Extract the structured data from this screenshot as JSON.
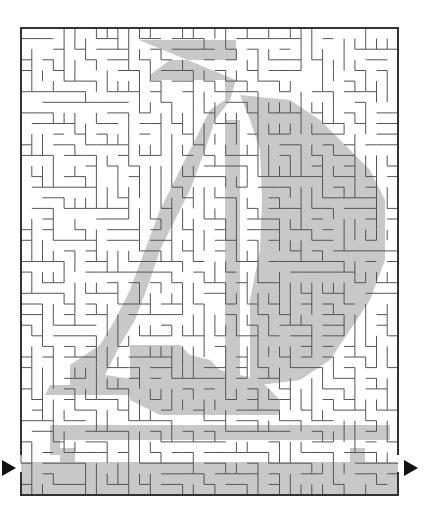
{
  "maze": {
    "title": "Sailboat maze",
    "bounds": {
      "x": 21,
      "y": 28,
      "width": 377,
      "height": 467
    },
    "cols": 35,
    "rows": 44,
    "wall_color": "#555555",
    "border_color": "#333333",
    "shade_color": "#c8c8c8",
    "entry_arrow": {
      "x": 2,
      "y": 460,
      "direction": "right"
    },
    "exit_arrow": {
      "x": 404,
      "y": 460,
      "direction": "right"
    }
  }
}
